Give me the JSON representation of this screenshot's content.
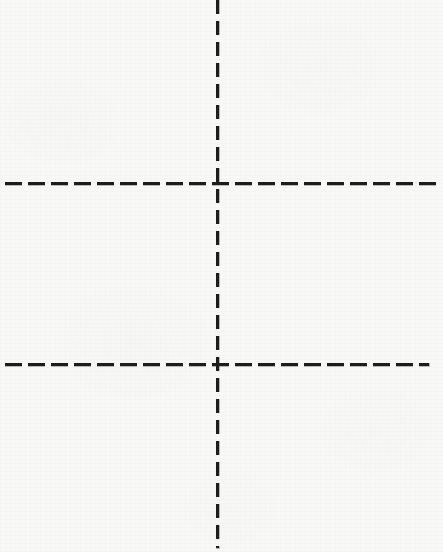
{
  "figure": {
    "canvas": {
      "width": 443,
      "height": 552,
      "background_color": "#f8f8f7",
      "ink_color": "#1d1d1d"
    },
    "lines": [
      {
        "id": "vertical-center-line",
        "orientation": "vertical",
        "x": 218,
        "y_start": 0,
        "y_end": 548,
        "thickness": 3,
        "dash_length": 14,
        "gap_length": 7,
        "color": "#1d1d1d"
      },
      {
        "id": "horizontal-upper-line",
        "orientation": "horizontal",
        "y": 184,
        "x_start": 5,
        "x_end": 441,
        "thickness": 3,
        "dash_length": 17,
        "gap_length": 6,
        "color": "#1d1d1d"
      },
      {
        "id": "horizontal-lower-line",
        "orientation": "horizontal",
        "y": 365,
        "x_start": 5,
        "x_end": 429,
        "thickness": 3,
        "dash_length": 17,
        "gap_length": 6,
        "color": "#1d1d1d"
      }
    ],
    "intersections": [
      {
        "id": "upper-crossing",
        "x": 218,
        "y": 184
      },
      {
        "id": "lower-crossing",
        "x": 218,
        "y": 365
      }
    ],
    "labels": []
  }
}
